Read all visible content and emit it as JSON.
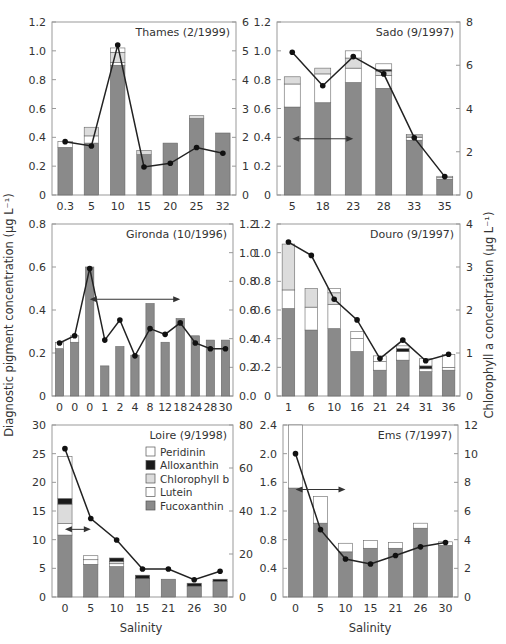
{
  "figure": {
    "left_ylabel": "Diagnostic pigment concentration (μg L⁻¹)",
    "right_ylabel": "Chlorophyll a concentration (μg L⁻¹)",
    "xlabel": "Salinity",
    "legend": [
      {
        "name": "Peridinin",
        "color": "#ffffff"
      },
      {
        "name": "Alloxanthin",
        "color": "#1a1a1a"
      },
      {
        "name": "Chlorophyll b",
        "color": "#dcdcdc"
      },
      {
        "name": "Lutein",
        "color": "#ffffff"
      },
      {
        "name": "Fucoxanthin",
        "color": "#8a8a8a"
      }
    ]
  },
  "chart_data": [
    {
      "type": "bar",
      "title": "Thames (2/1999)",
      "categories": [
        "0.3",
        "5",
        "10",
        "15",
        "20",
        "25",
        "32"
      ],
      "ylim": [
        0,
        1.2
      ],
      "yticks": [
        0,
        0.2,
        0.4,
        0.6,
        0.8,
        1.0,
        1.2
      ],
      "yticklabels": [
        "0",
        "0.2",
        "0.4",
        "0.6",
        "0.8",
        "1.0",
        "1.2"
      ],
      "y2lim": [
        0,
        6
      ],
      "y2ticks": [
        0,
        1,
        2,
        3,
        4,
        5,
        6
      ],
      "series": [
        {
          "name": "Fucoxanthin",
          "values": [
            0.33,
            0.36,
            0.9,
            0.28,
            0.36,
            0.53,
            0.43
          ]
        },
        {
          "name": "Lutein",
          "values": [
            0.04,
            0.05,
            0.02,
            0.0,
            0.0,
            0.0,
            0.0
          ]
        },
        {
          "name": "Chlorophyll b",
          "values": [
            0.0,
            0.06,
            0.07,
            0.03,
            0.0,
            0.02,
            0.0
          ]
        },
        {
          "name": "Alloxanthin",
          "values": [
            0,
            0,
            0,
            0,
            0,
            0,
            0
          ]
        },
        {
          "name": "Peridinin",
          "values": [
            0.0,
            0.0,
            0.03,
            0.0,
            0.0,
            0.0,
            0.0
          ]
        }
      ],
      "chlorophyll_a": [
        1.85,
        1.7,
        5.2,
        0.97,
        1.1,
        1.65,
        1.45
      ],
      "arrow": null
    },
    {
      "type": "bar",
      "title": "Sado (9/1997)",
      "categories": [
        "5",
        "18",
        "23",
        "28",
        "33",
        "35"
      ],
      "ylim": [
        0,
        1.2
      ],
      "yticks": [
        0,
        0.2,
        0.4,
        0.6,
        0.8,
        1.0,
        1.2
      ],
      "yticklabels": [
        "0",
        "0.2",
        "0.4",
        "0.6",
        "0.8",
        "1.0",
        "1.2"
      ],
      "y2lim": [
        0,
        8
      ],
      "y2ticks": [
        0,
        2,
        4,
        6,
        8
      ],
      "series": [
        {
          "name": "Fucoxanthin",
          "values": [
            0.61,
            0.64,
            0.78,
            0.74,
            0.38,
            0.11
          ]
        },
        {
          "name": "Lutein",
          "values": [
            0.16,
            0.2,
            0.1,
            0.09,
            0.02,
            0.01
          ]
        },
        {
          "name": "Chlorophyll b",
          "values": [
            0.05,
            0.04,
            0.07,
            0.03,
            0.01,
            0.0
          ]
        },
        {
          "name": "Alloxanthin",
          "values": [
            0,
            0,
            0,
            0.01,
            0,
            0
          ]
        },
        {
          "name": "Peridinin",
          "values": [
            0.0,
            0.0,
            0.05,
            0.04,
            0.01,
            0.01
          ]
        }
      ],
      "chlorophyll_a": [
        6.6,
        5.05,
        6.4,
        5.6,
        2.65,
        0.85
      ],
      "arrow": {
        "from": 0,
        "to": 2,
        "y": 0.39
      }
    },
    {
      "type": "bar",
      "title": "Gironda (10/1996)",
      "categories": [
        "0",
        "0",
        "0",
        "1",
        "2",
        "4",
        "8",
        "12",
        "18",
        "24",
        "28",
        "30"
      ],
      "ylim": [
        0,
        0.8
      ],
      "yticks": [
        0,
        0.2,
        0.4,
        0.6,
        0.8
      ],
      "yticklabels": [
        "0",
        "0.2",
        "0.4",
        "0.6",
        "0.8"
      ],
      "y2lim": [
        0,
        1.2
      ],
      "y2ticks": [
        0,
        0.2,
        0.4,
        0.6,
        0.8,
        1.0,
        1.2
      ],
      "series": [
        {
          "name": "Fucoxanthin",
          "values": [
            0.22,
            0.25,
            0.6,
            0.14,
            0.23,
            0.19,
            0.43,
            0.25,
            0.36,
            0.28,
            0.26,
            0.26
          ]
        },
        {
          "name": "Lutein",
          "values": [
            0.03,
            0.03,
            0,
            0,
            0,
            0,
            0,
            0,
            0,
            0,
            0,
            0
          ]
        },
        {
          "name": "Chlorophyll b",
          "values": [
            0,
            0,
            0,
            0,
            0,
            0,
            0,
            0,
            0,
            0,
            0,
            0
          ]
        },
        {
          "name": "Alloxanthin",
          "values": [
            0,
            0,
            0,
            0,
            0,
            0,
            0,
            0,
            0,
            0,
            0,
            0
          ]
        },
        {
          "name": "Peridinin",
          "values": [
            0,
            0,
            0,
            0,
            0,
            0,
            0,
            0,
            0,
            0,
            0,
            0
          ]
        }
      ],
      "chlorophyll_a": [
        0.37,
        0.42,
        0.89,
        0.39,
        0.53,
        0.28,
        0.47,
        0.43,
        0.51,
        0.37,
        0.33,
        0.33
      ],
      "arrow": {
        "from": 2,
        "to": 8,
        "y": 0.45
      }
    },
    {
      "type": "bar",
      "title": "Douro (9/1997)",
      "categories": [
        "1",
        "6",
        "10",
        "16",
        "21",
        "24",
        "31",
        "36"
      ],
      "ylim": [
        0,
        1.2
      ],
      "yticks": [
        0,
        0.2,
        0.4,
        0.6,
        0.8,
        1.0,
        1.2
      ],
      "yticklabels": [
        "0",
        "0.2",
        "0.4",
        "0.6",
        "0.8",
        "1.0",
        "1.2"
      ],
      "y2lim": [
        0,
        4
      ],
      "y2ticks": [
        0,
        1,
        2,
        3,
        4
      ],
      "series": [
        {
          "name": "Fucoxanthin",
          "values": [
            0.61,
            0.46,
            0.47,
            0.31,
            0.18,
            0.25,
            0.17,
            0.18
          ]
        },
        {
          "name": "Lutein",
          "values": [
            0.13,
            0.16,
            0.17,
            0.09,
            0.06,
            0.06,
            0.02,
            0.02
          ]
        },
        {
          "name": "Chlorophyll b",
          "values": [
            0.32,
            0.13,
            0.08,
            0.0,
            0.0,
            0.0,
            0.0,
            0.0
          ]
        },
        {
          "name": "Alloxanthin",
          "values": [
            0,
            0,
            0,
            0,
            0,
            0.02,
            0.02,
            0
          ]
        },
        {
          "name": "Peridinin",
          "values": [
            0.0,
            0.0,
            0.03,
            0.05,
            0.04,
            0.02,
            0.05,
            0.09
          ]
        }
      ],
      "chlorophyll_a": [
        3.58,
        3.27,
        2.25,
        1.77,
        0.87,
        1.3,
        0.82,
        0.97
      ],
      "arrow": null
    },
    {
      "type": "bar",
      "title": "Loire (9/1998)",
      "categories": [
        "0",
        "5",
        "10",
        "15",
        "21",
        "26",
        "30"
      ],
      "ylim": [
        0,
        30
      ],
      "yticks": [
        0,
        5,
        10,
        15,
        20,
        25,
        30
      ],
      "yticklabels": [
        "0",
        "5",
        "10",
        "15",
        "20",
        "25",
        "30"
      ],
      "y2lim": [
        0,
        80
      ],
      "y2ticks": [
        0,
        20,
        40,
        60,
        80
      ],
      "series": [
        {
          "name": "Fucoxanthin",
          "values": [
            10.8,
            5.7,
            5.3,
            3.2,
            3.1,
            1.9,
            2.7
          ]
        },
        {
          "name": "Lutein",
          "values": [
            2.0,
            0.8,
            0.5,
            0.0,
            0.0,
            0.0,
            0.0
          ]
        },
        {
          "name": "Chlorophyll b",
          "values": [
            3.4,
            0.0,
            0.4,
            0.0,
            0.0,
            0.0,
            0.0
          ]
        },
        {
          "name": "Alloxanthin",
          "values": [
            1.0,
            0.0,
            0.6,
            0.6,
            0.0,
            0.5,
            0.4
          ]
        },
        {
          "name": "Peridinin",
          "values": [
            7.3,
            0.7,
            0.0,
            0.0,
            0.0,
            0.0,
            0.0
          ]
        }
      ],
      "chlorophyll_a": [
        69,
        36.5,
        26.5,
        13,
        13,
        8,
        12
      ],
      "arrow": {
        "from": 0,
        "to": 1,
        "y": 11.8
      }
    },
    {
      "type": "bar",
      "title": "Ems (7/1997)",
      "categories": [
        "0",
        "5",
        "10",
        "15",
        "21",
        "26",
        "30"
      ],
      "ylim": [
        0,
        2.4
      ],
      "yticks": [
        0,
        0.4,
        0.8,
        1.2,
        1.6,
        2.0,
        2.4
      ],
      "yticklabels": [
        "0",
        "0.4",
        "0.8",
        "1.2",
        "1.6",
        "2.0",
        "2.4"
      ],
      "y2lim": [
        0,
        12
      ],
      "y2ticks": [
        0,
        2,
        4,
        6,
        8,
        10,
        12
      ],
      "series": [
        {
          "name": "Fucoxanthin",
          "values": [
            1.52,
            1.03,
            0.63,
            0.68,
            0.68,
            0.96,
            0.72
          ]
        },
        {
          "name": "Lutein",
          "values": [
            0,
            0,
            0,
            0,
            0,
            0,
            0
          ]
        },
        {
          "name": "Chlorophyll b",
          "values": [
            0,
            0,
            0,
            0,
            0,
            0,
            0
          ]
        },
        {
          "name": "Alloxanthin",
          "values": [
            0,
            0,
            0,
            0,
            0,
            0,
            0
          ]
        },
        {
          "name": "Peridinin",
          "values": [
            0.88,
            0.37,
            0.12,
            0.11,
            0.08,
            0.07,
            0.05
          ]
        }
      ],
      "chlorophyll_a": [
        10.0,
        4.7,
        2.65,
        2.3,
        2.9,
        3.5,
        3.8
      ],
      "arrow": {
        "from": 0,
        "to": 2,
        "y": 1.5
      }
    }
  ]
}
